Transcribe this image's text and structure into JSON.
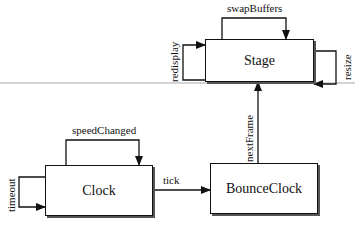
{
  "diagram": {
    "nodes": [
      {
        "id": "stage",
        "label": "Stage"
      },
      {
        "id": "clock",
        "label": "Clock"
      },
      {
        "id": "bounceclock",
        "label": "BounceClock"
      }
    ],
    "edges": [
      {
        "from": "stage",
        "to": "stage",
        "label": "swapBuffers"
      },
      {
        "from": "stage",
        "to": "stage",
        "label": "redisplay"
      },
      {
        "from": "stage",
        "to": "stage",
        "label": "resize"
      },
      {
        "from": "clock",
        "to": "clock",
        "label": "speedChanged"
      },
      {
        "from": "clock",
        "to": "clock",
        "label": "timeout"
      },
      {
        "from": "clock",
        "to": "bounceclock",
        "label": "tick"
      },
      {
        "from": "bounceclock",
        "to": "stage",
        "label": "nextFrame"
      }
    ]
  }
}
